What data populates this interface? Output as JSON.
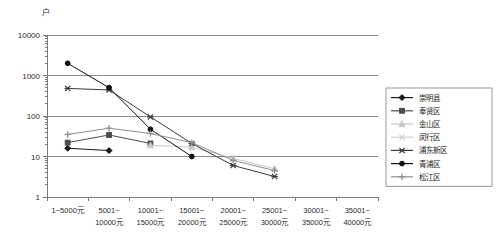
{
  "chart_data": {
    "type": "line",
    "title": "",
    "xlabel": "",
    "ylabel": "户",
    "yscale": "log",
    "ylim": [
      1,
      10000
    ],
    "grid": true,
    "legend_position": "right",
    "ytick_labels": [
      "10000",
      "1000",
      "100",
      "10",
      "1"
    ],
    "ytick_values": [
      10000,
      1000,
      100,
      10,
      1
    ],
    "categories": [
      "1~5000元",
      "5001~\n10000元",
      "10001~\n15000元",
      "15001~\n20000元",
      "20001~\n25000元",
      "25001~\n30000元",
      "30001~\n35000元",
      "35001~\n40000元"
    ],
    "category_lines": [
      [
        "1~5000元",
        ""
      ],
      [
        "5001~",
        "10000元"
      ],
      [
        "10001~",
        "15000元"
      ],
      [
        "15001~",
        "20000元"
      ],
      [
        "20001~",
        "25000元"
      ],
      [
        "25001~",
        "30000元"
      ],
      [
        "30001~",
        "35000元"
      ],
      [
        "35001~",
        "40000元"
      ]
    ],
    "series": [
      {
        "name": "崇明县",
        "marker": "diamond",
        "color": "#1a1a1a",
        "values": [
          16,
          14,
          null,
          null,
          null,
          null,
          null,
          null
        ]
      },
      {
        "name": "奉贤区",
        "marker": "square",
        "color": "#4d4d4d",
        "values": [
          22,
          34,
          21,
          null,
          null,
          null,
          null,
          null
        ]
      },
      {
        "name": "金山区",
        "marker": "triangle",
        "color": "#c8c8c8",
        "values": [
          null,
          null,
          19,
          17,
          9,
          5,
          null,
          null
        ]
      },
      {
        "name": "闵行区",
        "marker": "cross",
        "color": "#d2d2d2",
        "values": [
          null,
          null,
          null,
          null,
          null,
          null,
          null,
          null
        ]
      },
      {
        "name": "浦东新区",
        "marker": "asterisk",
        "color": "#3a3a3a",
        "values": [
          480,
          440,
          95,
          21,
          6,
          3.2,
          null,
          null
        ]
      },
      {
        "name": "青浦区",
        "marker": "circle",
        "color": "#111111",
        "values": [
          2000,
          500,
          47,
          10,
          null,
          null,
          null,
          null
        ]
      },
      {
        "name": "松江区",
        "marker": "plus",
        "color": "#8f8f8f",
        "values": [
          35,
          50,
          37,
          22,
          8,
          4.5,
          null,
          null
        ]
      }
    ]
  },
  "legend": {
    "entries": [
      "崇明县",
      "奉贤区",
      "金山区",
      "闵行区",
      "浦东新区",
      "青浦区",
      "松江区"
    ]
  }
}
